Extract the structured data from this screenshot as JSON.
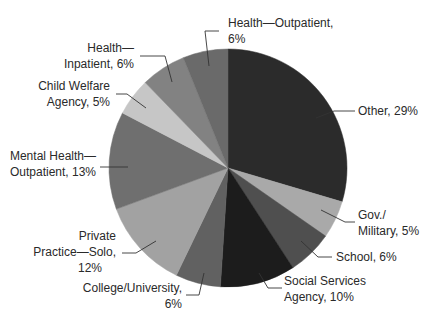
{
  "chart_data": {
    "type": "pie",
    "title": "",
    "start_angle_deg": 0,
    "direction": "clockwise",
    "center": [
      228,
      168
    ],
    "radius": 119,
    "slices": [
      {
        "name": "Other",
        "value": 29,
        "label_lines": [
          "Other, 29%"
        ],
        "color": "#2b2b2b",
        "leader": [
          [
            316,
            118
          ],
          [
            334,
            111
          ],
          [
            355,
            111
          ]
        ],
        "label_x": 358,
        "label_y": 115,
        "anchor": "start"
      },
      {
        "name": "Gov./Military",
        "value": 5,
        "label_lines": [
          "Gov./",
          "Military, 5%"
        ],
        "color": "#a9a9a9",
        "leader": [
          [
            321,
            210
          ],
          [
            345,
            222
          ],
          [
            355,
            222
          ]
        ],
        "label_x": 358,
        "label_y": 219,
        "anchor": "start"
      },
      {
        "name": "School",
        "value": 6,
        "label_lines": [
          "School, 6%"
        ],
        "color": "#4f4f4f",
        "leader": [
          [
            301,
            241
          ],
          [
            318,
            257
          ],
          [
            332,
            257
          ]
        ],
        "label_x": 336,
        "label_y": 261,
        "anchor": "start"
      },
      {
        "name": "Social Services Agency",
        "value": 10,
        "label_lines": [
          "Social Services",
          "Agency, 10%"
        ],
        "color": "#1c1c1c",
        "leader": [
          [
            259,
            273
          ],
          [
            268,
            288
          ],
          [
            282,
            288
          ]
        ],
        "label_x": 284,
        "label_y": 285,
        "anchor": "start"
      },
      {
        "name": "College/University",
        "value": 6,
        "label_lines": [
          "College/University,",
          "6%"
        ],
        "color": "#616161",
        "leader": [
          [
            204,
            273
          ],
          [
            199,
            295
          ],
          [
            186,
            295
          ]
        ],
        "label_x": 182,
        "label_y": 292,
        "anchor": "end"
      },
      {
        "name": "Private Practice—Solo",
        "value": 12,
        "label_lines": [
          "Private",
          "Practice—Solo,",
          "12%"
        ],
        "color": "#a2a2a2",
        "leader": [
          [
            156,
            241
          ],
          [
            136,
            253
          ],
          [
            122,
            253
          ]
        ],
        "label_x": 116,
        "label_y": 240,
        "anchor": "end"
      },
      {
        "name": "Mental Health—Outpatient",
        "value": 13,
        "label_lines": [
          "Mental Health—",
          "Outpatient, 13%"
        ],
        "color": "#6f6f6f",
        "leader": [
          [
            128,
            167
          ],
          [
            100,
            167
          ]
        ],
        "label_x": 96,
        "label_y": 160,
        "anchor": "end"
      },
      {
        "name": "Child Welfare Agency",
        "value": 5,
        "label_lines": [
          "Child Welfare",
          "Agency, 5%"
        ],
        "color": "#c6c6c6",
        "leader": [
          [
            146,
            108
          ],
          [
            127,
            94
          ],
          [
            116,
            94
          ]
        ],
        "label_x": 110,
        "label_y": 90,
        "anchor": "end"
      },
      {
        "name": "Health—Inpatient",
        "value": 6,
        "label_lines": [
          "Health—",
          "Inpatient, 6%"
        ],
        "color": "#828282",
        "leader": [
          [
            172,
            82
          ],
          [
            165,
            56
          ],
          [
            140,
            56
          ]
        ],
        "label_x": 134,
        "label_y": 52,
        "anchor": "end"
      },
      {
        "name": "Health—Outpatient",
        "value": 6,
        "label_lines": [
          "Health—Outpatient,",
          "6%"
        ],
        "color": "#6a6a6a",
        "leader": [
          [
            209,
            66
          ],
          [
            205,
            31
          ],
          [
            219,
            31
          ]
        ],
        "label_x": 228,
        "label_y": 27,
        "anchor": "start"
      }
    ],
    "legend": "none (direct labels with leader lines)"
  }
}
